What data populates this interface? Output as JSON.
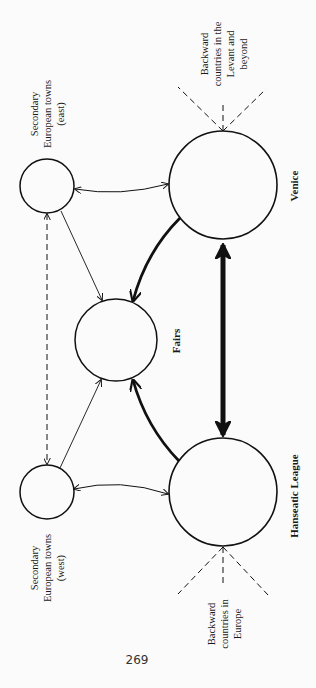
{
  "diagram": {
    "orientation": "rotated 90 degrees counter-clockwise (text reads bottom-to-top)",
    "colors": {
      "background": "#fbfbfb",
      "ink": "#111111"
    },
    "nodes": [
      {
        "id": "venice",
        "label": "Venice",
        "bold": true
      },
      {
        "id": "hanseatic",
        "label": "Hanseatic League",
        "bold": true
      },
      {
        "id": "fairs",
        "label": "Fairs",
        "bold": true
      },
      {
        "id": "towns_east",
        "label_lines": [
          "Secondary",
          "European towns",
          "(east)"
        ]
      },
      {
        "id": "towns_west",
        "label_lines": [
          "Secondary",
          "European towns",
          "(west)"
        ]
      }
    ],
    "peripheries": [
      {
        "id": "levant",
        "attached_to": "venice",
        "label_lines": [
          "Backward",
          "countries in the",
          "Levant and",
          "beyond"
        ]
      },
      {
        "id": "europe",
        "attached_to": "hanseatic",
        "label_lines": [
          "Backward",
          "countries in",
          "Europe"
        ]
      }
    ],
    "edges": [
      {
        "from": "venice",
        "to": "hanseatic",
        "style": "very thick",
        "direction": "both"
      },
      {
        "from": "venice",
        "to": "fairs",
        "style": "thick curved",
        "direction": "to fairs"
      },
      {
        "from": "hanseatic",
        "to": "fairs",
        "style": "thick curved",
        "direction": "to fairs"
      },
      {
        "from": "towns_east",
        "to": "fairs",
        "style": "thin",
        "direction": "to fairs"
      },
      {
        "from": "towns_west",
        "to": "fairs",
        "style": "thin",
        "direction": "to fairs"
      },
      {
        "from": "towns_east",
        "to": "venice",
        "style": "thin curved",
        "direction": "both"
      },
      {
        "from": "towns_west",
        "to": "hanseatic",
        "style": "thin curved",
        "direction": "both"
      },
      {
        "from": "towns_east",
        "to": "towns_west",
        "style": "thin dashed",
        "direction": "both"
      }
    ],
    "page_number": "269"
  }
}
